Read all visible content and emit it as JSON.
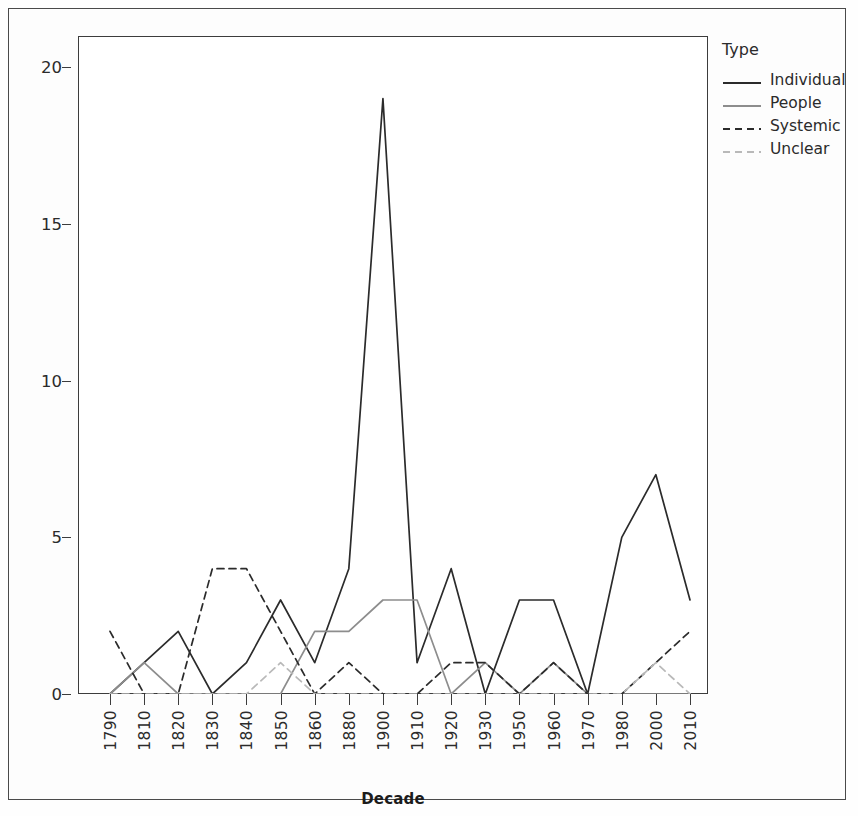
{
  "legend": {
    "title": "Type",
    "entries": [
      {
        "label": "Individual",
        "color": "#2b2b2b",
        "dash": "solid"
      },
      {
        "label": "People",
        "color": "#8d8d8d",
        "dash": "solid"
      },
      {
        "label": "Systemic",
        "color": "#2b2b2b",
        "dash": "dashed"
      },
      {
        "label": "Unclear",
        "color": "#b9b9b9",
        "dash": "dashed"
      }
    ]
  },
  "axes": {
    "x_title": "Decade",
    "y_title": "",
    "y_ticks": [
      "0",
      "5",
      "10",
      "15",
      "20"
    ]
  },
  "chart_data": {
    "type": "line",
    "title": "",
    "xlabel": "Decade",
    "ylabel": "",
    "xlim": [
      1790,
      2010
    ],
    "ylim": [
      0,
      21
    ],
    "y_ticks": [
      0,
      5,
      10,
      15,
      20
    ],
    "grid": false,
    "legend_position": "right",
    "legend_title": "Type",
    "categories": [
      "1790",
      "1810",
      "1820",
      "1830",
      "1840",
      "1850",
      "1860",
      "1880",
      "1900",
      "1910",
      "1920",
      "1930",
      "1950",
      "1960",
      "1970",
      "1980",
      "2000",
      "2010"
    ],
    "series": [
      {
        "name": "Individual",
        "color": "#2b2b2b",
        "dash": "solid",
        "values": [
          0,
          1,
          2,
          0,
          1,
          3,
          1,
          4,
          19,
          1,
          4,
          0,
          3,
          3,
          0,
          5,
          7,
          3
        ]
      },
      {
        "name": "People",
        "color": "#8d8d8d",
        "dash": "solid",
        "values": [
          0,
          1,
          0,
          0,
          0,
          0,
          2,
          2,
          3,
          3,
          0,
          1,
          0,
          1,
          0,
          0,
          0,
          0
        ]
      },
      {
        "name": "Systemic",
        "color": "#2b2b2b",
        "dash": "dashed",
        "values": [
          2,
          0,
          0,
          4,
          4,
          2,
          0,
          1,
          0,
          0,
          1,
          1,
          0,
          1,
          0,
          0,
          1,
          2
        ]
      },
      {
        "name": "Unclear",
        "color": "#b9b9b9",
        "dash": "dashed",
        "values": [
          0,
          0,
          0,
          0,
          0,
          1,
          0,
          0,
          0,
          0,
          0,
          0,
          0,
          0,
          0,
          0,
          1,
          0
        ]
      }
    ]
  }
}
